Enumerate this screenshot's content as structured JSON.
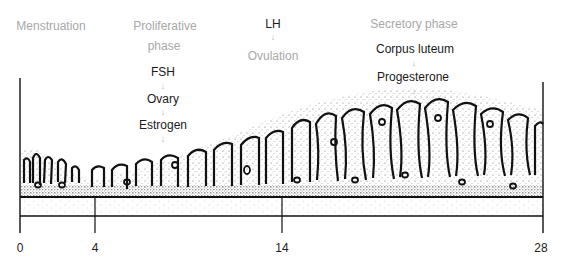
{
  "diagram": {
    "phases": {
      "menstruation": "Menstruation",
      "proliferative_line1": "Proliferative",
      "proliferative_line2": "phase",
      "ovulation": "Ovulation",
      "secretory": "Secretory phase"
    },
    "hormones": {
      "fsh": "FSH",
      "ovary": "Ovary",
      "estrogen": "Estrogen",
      "lh": "LH",
      "corpus_luteum": "Corpus luteum",
      "progesterone": "Progesterone"
    },
    "arrow_glyph": "↓",
    "axis": {
      "ticks": [
        {
          "label": "0",
          "day": 0
        },
        {
          "label": "4",
          "day": 4
        },
        {
          "label": "14",
          "day": 14
        },
        {
          "label": "28",
          "day": 28
        }
      ],
      "unit": "day of cycle"
    },
    "colors": {
      "phase_text": "#a8a8a8",
      "hormone_text": "#1a1a1a",
      "arrow": "#b0b0b0",
      "ink": "#111111"
    }
  }
}
